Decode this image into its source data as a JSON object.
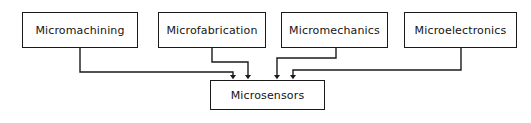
{
  "diagram": {
    "background_color": "#ffffff",
    "line_color": "#1a1a1a",
    "text_color": "#141414",
    "sources": [
      {
        "id": "micromachining",
        "label": "Micromachining"
      },
      {
        "id": "microfabrication",
        "label": "Microfabrication"
      },
      {
        "id": "micromechanics",
        "label": "Micromechanics"
      },
      {
        "id": "microelectronics",
        "label": "Microelectronics"
      }
    ],
    "target": {
      "id": "microsensors",
      "label": "Microsensors"
    },
    "connectors": [
      {
        "from": "micromachining",
        "to": "microsensors",
        "arrow": "down"
      },
      {
        "from": "microfabrication",
        "to": "microsensors",
        "arrow": "down"
      },
      {
        "from": "micromechanics",
        "to": "microsensors",
        "arrow": "down"
      },
      {
        "from": "microelectronics",
        "to": "microsensors",
        "arrow": "down"
      }
    ]
  }
}
